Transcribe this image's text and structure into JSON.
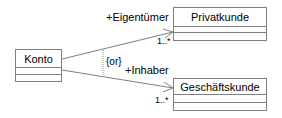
{
  "diagram": {
    "type": "uml-class-diagram",
    "classes": [
      {
        "id": "konto",
        "name": "Konto"
      },
      {
        "id": "privatkunde",
        "name": "Privatkunde"
      },
      {
        "id": "geschaeftskunde",
        "name": "Geschäftskunde"
      }
    ],
    "associations": [
      {
        "from": "Konto",
        "to": "Privatkunde",
        "role": "+Eigentümer",
        "multiplicity": "1..*",
        "navigable": true
      },
      {
        "from": "Konto",
        "to": "Geschäftskunde",
        "role": "+Inhaber",
        "multiplicity": "1..*",
        "navigable": true
      }
    ],
    "constraint": {
      "label": "{or}"
    }
  }
}
